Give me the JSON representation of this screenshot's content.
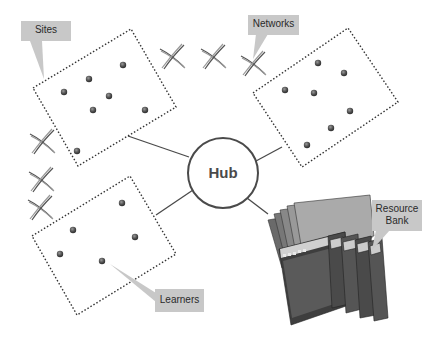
{
  "diagram": {
    "hub": {
      "label": "Hub",
      "center": [
        223,
        173
      ],
      "radius": 35
    },
    "callouts": [
      {
        "id": "sites",
        "label": "Sites"
      },
      {
        "id": "networks",
        "label": "Networks"
      },
      {
        "id": "resource-bank",
        "label_line1": "Resource",
        "label_line2": "Bank"
      },
      {
        "id": "learners",
        "label": "Learners"
      }
    ],
    "groups": [
      {
        "id": "top-left-site",
        "node_count": 7
      },
      {
        "id": "top-right-site",
        "node_count": 7
      },
      {
        "id": "bottom-left-site",
        "node_count": 5
      }
    ],
    "network_links": {
      "top_row_count": 3,
      "left_column_count": 3
    },
    "resource_bank": {
      "window_count": 9
    },
    "colors": {
      "callout_fill": "#c8c8c8",
      "line": "#4a4a4a",
      "dotted_border": "#333333",
      "node": "#555555",
      "background": "#ffffff"
    }
  }
}
